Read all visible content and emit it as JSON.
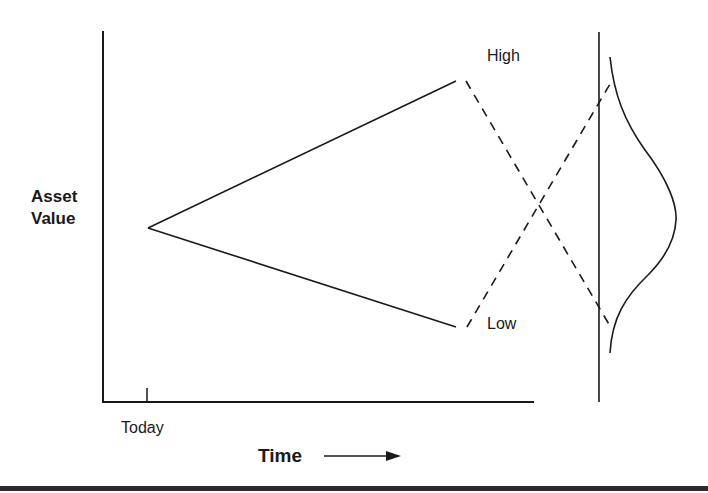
{
  "diagram": {
    "y_axis_label_line1": "Asset",
    "y_axis_label_line2": "Value",
    "x_axis_label": "Time",
    "x_tick_label": "Today",
    "high_label": "High",
    "low_label": "Low"
  },
  "elements": {
    "start_point": {
      "x": 148,
      "y": 228
    },
    "high_end": {
      "x": 456,
      "y": 81
    },
    "low_end": {
      "x": 456,
      "y": 327
    },
    "valuation_line_x": 599,
    "distribution_curve": "bell-shaped probability distribution on right side"
  },
  "colors": {
    "line": "#1a1a1a",
    "background": "#ffffff"
  }
}
